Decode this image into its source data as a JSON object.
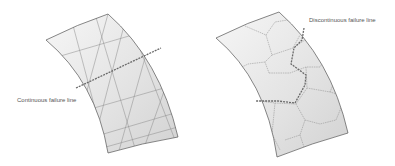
{
  "figure": {
    "left_panel": {
      "label": "Continuous failure line",
      "description": "Curved shell panel with diagonal crossing grid; straight continuous failure line crossing"
    },
    "right_panel": {
      "label": "Discontinuous failure line",
      "description": "Curved shell panel with polygonal cell pattern; zig-zag discontinuous failure line through cell boundaries"
    },
    "colors": {
      "shell_fill_light": "#f4f4f4",
      "shell_fill_dark": "#d6d6d6",
      "outline": "#555555",
      "grid_line": "#8a8a8a",
      "failure_line": "#6a6a6a",
      "label_text": "#555555"
    }
  }
}
